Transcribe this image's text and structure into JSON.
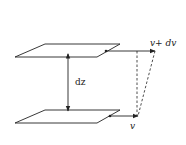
{
  "diagram": {
    "labels": {
      "separation": "dz",
      "top_velocity": "v+ dv",
      "bottom_velocity": "v"
    },
    "colors": {
      "stroke": "#222222",
      "background": "#ffffff"
    }
  }
}
